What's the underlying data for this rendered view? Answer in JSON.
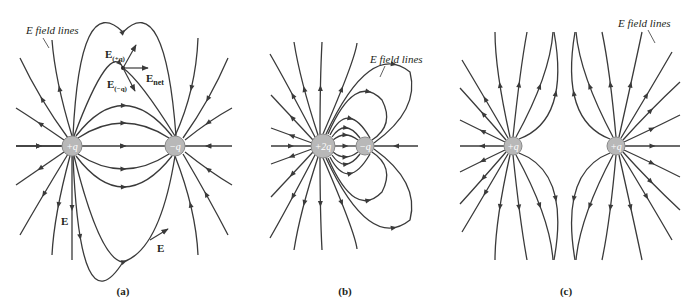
{
  "diagrams": [
    {
      "id": "a",
      "caption": "(a)",
      "charges": [
        {
          "label": "+q",
          "x": 72,
          "y": 146,
          "r": 10
        },
        {
          "label": "−q",
          "x": 175,
          "y": 146,
          "r": 10
        }
      ],
      "labels": {
        "field_lines": "E field lines",
        "e_plus": "E",
        "e_plus_sub": "(+q)",
        "e_minus": "E",
        "e_minus_sub": "(−q)",
        "e_net": "E",
        "e_net_sub": "net",
        "e_left": "E",
        "e_bottom": "E"
      }
    },
    {
      "id": "b",
      "caption": "(b)",
      "charges": [
        {
          "label": "+2q",
          "x": 323,
          "y": 146,
          "r": 12
        },
        {
          "label": "−q",
          "x": 365,
          "y": 146,
          "r": 9
        }
      ],
      "labels": {
        "field_lines": "E field lines"
      }
    },
    {
      "id": "c",
      "caption": "(c)",
      "charges": [
        {
          "label": "+q",
          "x": 513,
          "y": 146,
          "r": 9
        },
        {
          "label": "+q",
          "x": 616,
          "y": 146,
          "r": 9
        }
      ],
      "labels": {
        "field_lines": "E field lines"
      }
    }
  ],
  "colors": {
    "line": "#3a3a3a",
    "charge_fill": "#b8b8b8",
    "text": "#231f20"
  }
}
